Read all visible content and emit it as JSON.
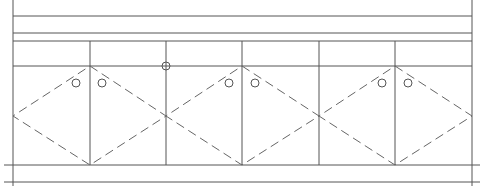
{
  "drawing": {
    "type": "cabinet-elevation",
    "colors": {
      "line": "#555555",
      "dash": "#666666",
      "background": "#ffffff"
    },
    "frame": {
      "left_x": 13,
      "right_x": 472,
      "top_y": 0,
      "bottom_y": 186
    },
    "horizontal_lines": [
      {
        "y": 16,
        "x1": 13,
        "x2": 472
      },
      {
        "y": 33,
        "x1": 13,
        "x2": 472
      },
      {
        "y": 41,
        "x1": 13,
        "x2": 472
      },
      {
        "y": 66,
        "x1": 13,
        "x2": 472
      },
      {
        "y": 165,
        "x1": 4,
        "x2": 480
      },
      {
        "y": 182,
        "x1": 4,
        "x2": 480
      }
    ],
    "vertical_dividers": [
      {
        "x": 90,
        "y1": 41,
        "y2": 165
      },
      {
        "x": 166,
        "y1": 41,
        "y2": 165
      },
      {
        "x": 242,
        "y1": 41,
        "y2": 165
      },
      {
        "x": 319,
        "y1": 41,
        "y2": 165
      },
      {
        "x": 395,
        "y1": 41,
        "y2": 165
      }
    ],
    "diamonds": [
      {
        "top": [
          90,
          66
        ],
        "left": [
          13,
          116
        ],
        "bottom": [
          90,
          165
        ],
        "right": [
          166,
          116
        ]
      },
      {
        "top": [
          242,
          66
        ],
        "left": [
          166,
          116
        ],
        "bottom": [
          242,
          165
        ],
        "right": [
          319,
          116
        ]
      },
      {
        "top": [
          395,
          66
        ],
        "left": [
          319,
          116
        ],
        "bottom": [
          395,
          165
        ],
        "right": [
          472,
          116
        ]
      }
    ],
    "knobs": [
      {
        "cx": 76,
        "cy": 83,
        "r": 4
      },
      {
        "cx": 102,
        "cy": 83,
        "r": 4
      },
      {
        "cx": 166,
        "cy": 66,
        "r": 4
      },
      {
        "cx": 229,
        "cy": 83,
        "r": 4
      },
      {
        "cx": 255,
        "cy": 83,
        "r": 4
      },
      {
        "cx": 382,
        "cy": 83,
        "r": 4
      },
      {
        "cx": 408,
        "cy": 83,
        "r": 4
      }
    ]
  }
}
